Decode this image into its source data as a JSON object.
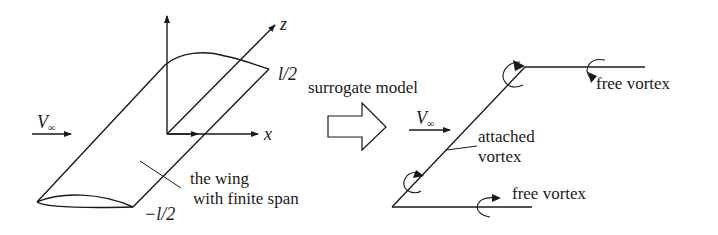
{
  "left_panel": {
    "flow_label": "V",
    "flow_subscript": "∞",
    "axis_x": "x",
    "axis_z": "z",
    "span_top": "l/2",
    "span_bottom": "−l/2",
    "wing_label_line1": "the wing",
    "wing_label_line2": "with finite span"
  },
  "transition": {
    "label": "surrogate model",
    "arrow_icon": "hollow-right-arrow"
  },
  "right_panel": {
    "flow_label": "V",
    "flow_subscript": "∞",
    "attached_line1": "attached",
    "attached_line2": "vortex",
    "free_vortex_top": "free vortex",
    "free_vortex_bottom": "free vortex"
  },
  "colors": {
    "stroke": "#1a1a1a",
    "background": "#ffffff"
  }
}
